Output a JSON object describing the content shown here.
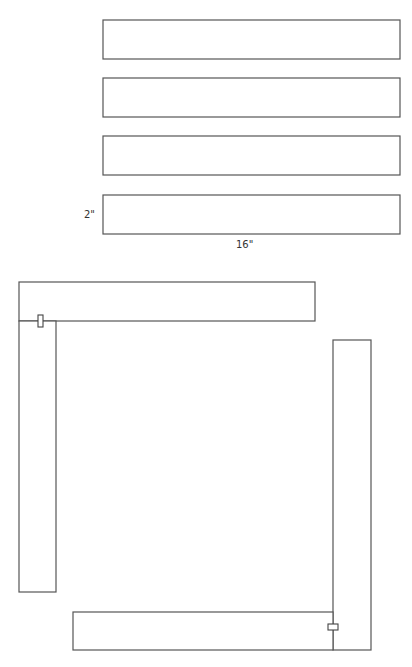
{
  "diagram": {
    "strips": [
      {
        "id": "strip-1",
        "x": 103,
        "y": 20,
        "w": 297,
        "h": 39
      },
      {
        "id": "strip-2",
        "x": 103,
        "y": 78,
        "w": 297,
        "h": 39
      },
      {
        "id": "strip-3",
        "x": 103,
        "y": 136,
        "w": 297,
        "h": 39
      },
      {
        "id": "strip-4",
        "x": 103,
        "y": 195,
        "w": 297,
        "h": 39
      }
    ],
    "dimensions": {
      "height_label": "2\"",
      "width_label": "16\""
    },
    "assembly": {
      "top_bar": {
        "x": 19,
        "y": 282,
        "w": 296,
        "h": 39
      },
      "left_bar": {
        "x": 19,
        "y": 321,
        "w": 37,
        "h": 271
      },
      "right_bar": {
        "x": 333,
        "y": 340,
        "w": 38,
        "h": 310
      },
      "bottom_bar": {
        "x": 73,
        "y": 612,
        "w": 260,
        "h": 38
      },
      "clamps": [
        {
          "id": "clamp-top-left",
          "x": 38,
          "y": 315,
          "w": 5,
          "h": 12
        },
        {
          "id": "clamp-bottom-right",
          "x": 328,
          "y": 624,
          "w": 10,
          "h": 6
        }
      ]
    }
  }
}
